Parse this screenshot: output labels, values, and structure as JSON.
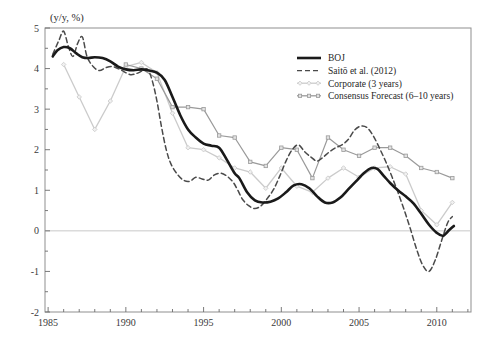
{
  "chart_data": {
    "type": "line",
    "title": "",
    "subtitle": "",
    "ylabel": "(y/y, %)",
    "xlabel": "",
    "xlim": [
      1984.8,
      2012.2
    ],
    "ylim": [
      -2,
      5
    ],
    "yticks": [
      -2,
      -1,
      0,
      1,
      2,
      3,
      4,
      5
    ],
    "ytick_labels": [
      "-2",
      "-1",
      "0",
      "1",
      "2",
      "3",
      "4",
      "5"
    ],
    "yminor_step": 0.5,
    "xticks": [
      1985,
      1990,
      1995,
      2000,
      2005,
      2010
    ],
    "xtick_labels": [
      "1985",
      "1990",
      "1995",
      "2000",
      "2005",
      "2010"
    ],
    "xminor_step": 1,
    "grid": false,
    "zero_line": true,
    "legend_position": "top-right",
    "series": [
      {
        "name": "BOJ",
        "style": "solid",
        "color": "#1a1a1a",
        "width": 2.6,
        "marker": "none",
        "x": [
          1985.3,
          1985.6,
          1986.0,
          1986.4,
          1986.8,
          1987.2,
          1987.6,
          1988.0,
          1988.5,
          1989.0,
          1989.5,
          1990.0,
          1990.5,
          1991.0,
          1991.5,
          1992.0,
          1992.5,
          1993.0,
          1993.5,
          1994.0,
          1994.5,
          1995.0,
          1995.5,
          1996.0,
          1996.5,
          1997.0,
          1997.3,
          1997.8,
          1998.3,
          1998.8,
          1999.3,
          1999.8,
          2000.3,
          2000.8,
          2001.3,
          2001.8,
          2002.3,
          2002.8,
          2003.3,
          2003.8,
          2004.3,
          2004.8,
          2005.3,
          2005.8,
          2006.2,
          2006.6,
          2007.0,
          2007.5,
          2008.0,
          2008.5,
          2009.0,
          2009.5,
          2010.0,
          2010.4,
          2010.8,
          2011.1
        ],
        "y": [
          4.3,
          4.45,
          4.53,
          4.5,
          4.38,
          4.28,
          4.26,
          4.28,
          4.26,
          4.18,
          4.05,
          3.98,
          3.96,
          3.98,
          3.95,
          3.9,
          3.72,
          3.3,
          2.85,
          2.5,
          2.3,
          2.15,
          2.1,
          2.05,
          1.75,
          1.42,
          1.3,
          0.95,
          0.75,
          0.7,
          0.72,
          0.8,
          0.95,
          1.12,
          1.15,
          1.05,
          0.85,
          0.7,
          0.7,
          0.82,
          1.02,
          1.22,
          1.42,
          1.55,
          1.52,
          1.35,
          1.18,
          1.0,
          0.85,
          0.68,
          0.42,
          0.15,
          -0.05,
          -0.12,
          0.02,
          0.12
        ]
      },
      {
        "name": "Saitō et al. (2012)",
        "style": "dashed",
        "color": "#4a4a4a",
        "width": 1.5,
        "marker": "none",
        "x": [
          1985.3,
          1985.7,
          1986.0,
          1986.3,
          1986.6,
          1986.9,
          1987.2,
          1987.5,
          1987.9,
          1988.3,
          1988.7,
          1989.1,
          1989.5,
          1989.9,
          1990.3,
          1990.7,
          1991.1,
          1991.4,
          1991.7,
          1992.0,
          1992.3,
          1992.6,
          1992.9,
          1993.3,
          1993.7,
          1994.1,
          1994.5,
          1994.9,
          1995.3,
          1995.7,
          1996.1,
          1996.5,
          1996.9,
          1997.2,
          1997.5,
          1997.9,
          1998.3,
          1998.7,
          1999.1,
          1999.5,
          1999.9,
          2000.3,
          2000.7,
          2001.1,
          2001.5,
          2001.9,
          2002.3,
          2002.7,
          2003.1,
          2003.5,
          2003.9,
          2004.3,
          2004.7,
          2005.1,
          2005.5,
          2005.9,
          2006.3,
          2006.7,
          2007.1,
          2007.5,
          2007.9,
          2008.3,
          2008.7,
          2009.1,
          2009.5,
          2009.9,
          2010.3,
          2010.7,
          2011.0
        ],
        "y": [
          4.35,
          4.7,
          4.92,
          4.55,
          4.3,
          4.62,
          4.78,
          4.3,
          4.05,
          3.95,
          4.02,
          4.05,
          4.0,
          3.92,
          3.85,
          3.88,
          3.95,
          3.98,
          3.7,
          3.2,
          2.55,
          2.0,
          1.65,
          1.4,
          1.25,
          1.22,
          1.32,
          1.28,
          1.25,
          1.38,
          1.42,
          1.35,
          1.2,
          1.0,
          0.78,
          0.62,
          0.55,
          0.62,
          0.8,
          1.02,
          1.35,
          1.72,
          2.0,
          2.12,
          1.95,
          1.82,
          1.72,
          1.82,
          1.95,
          2.05,
          2.12,
          2.25,
          2.48,
          2.58,
          2.55,
          2.35,
          2.05,
          1.72,
          1.35,
          0.95,
          0.52,
          0.05,
          -0.45,
          -0.85,
          -1.0,
          -0.72,
          -0.25,
          0.2,
          0.35
        ]
      },
      {
        "name": "Corporate (3 years)",
        "style": "solid",
        "color": "#cbcbcb",
        "width": 1.3,
        "marker": "diamond",
        "x": [
          1986.0,
          1987.0,
          1988.0,
          1989.0,
          1990.0,
          1991.0,
          1992.0,
          1993.0,
          1994.0,
          1995.0,
          1996.0,
          1997.0,
          1998.0,
          1999.0,
          2000.0,
          2001.0,
          2002.0,
          2003.0,
          2004.0,
          2005.0,
          2006.0,
          2007.0,
          2008.0,
          2009.0,
          2010.0,
          2011.0
        ],
        "y": [
          4.1,
          3.3,
          2.5,
          3.2,
          4.05,
          4.15,
          3.9,
          2.9,
          2.05,
          2.0,
          1.8,
          1.55,
          1.45,
          1.05,
          1.55,
          1.1,
          0.95,
          1.3,
          1.55,
          1.32,
          1.55,
          1.58,
          1.4,
          0.5,
          0.15,
          0.7
        ]
      },
      {
        "name": "Consensus Forecast (6–10 years)",
        "style": "solid",
        "color": "#9a9a9a",
        "width": 1.2,
        "marker": "square",
        "x": [
          1990.0,
          1991.0,
          1992.0,
          1993.0,
          1994.0,
          1995.0,
          1996.0,
          1997.0,
          1998.0,
          1999.0,
          2000.0,
          2001.0,
          2002.0,
          2003.0,
          2004.0,
          2005.0,
          2006.0,
          2007.0,
          2008.0,
          2009.0,
          2010.0,
          2011.0
        ],
        "y": [
          4.1,
          4.0,
          3.75,
          3.05,
          3.05,
          3.0,
          2.35,
          2.3,
          1.7,
          1.6,
          2.05,
          2.0,
          1.3,
          2.3,
          2.0,
          1.85,
          2.05,
          2.05,
          1.85,
          1.55,
          1.45,
          1.3
        ]
      }
    ]
  },
  "legend": {
    "entries": [
      {
        "label": "BOJ"
      },
      {
        "label": "Saitō et al. (2012)"
      },
      {
        "label": "Corporate (3 years)"
      },
      {
        "label": "Consensus Forecast (6–10 years)"
      }
    ]
  }
}
